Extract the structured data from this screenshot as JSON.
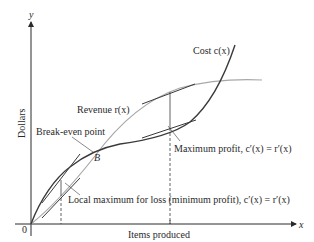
{
  "diagram": {
    "axes": {
      "y_label": "y",
      "x_label": "x",
      "origin_label": "0",
      "y_title": "Dollars",
      "x_title": "Items produced"
    },
    "curves": {
      "cost_label": "Cost c(x)",
      "revenue_label": "Revenue r(x)"
    },
    "annotations": {
      "break_even": "Break-even point",
      "point_b": "B",
      "max_profit": "Maximum profit, c′(x) = r′(x)",
      "local_max_loss": "Local maximum for loss (minimum profit), c′(x) = r′(x)"
    },
    "colors": {
      "cost_curve": "#3a3a3a",
      "revenue_curve": "#a8a8a8",
      "axes": "#2a2a2a",
      "text": "#2a2a2a"
    }
  }
}
